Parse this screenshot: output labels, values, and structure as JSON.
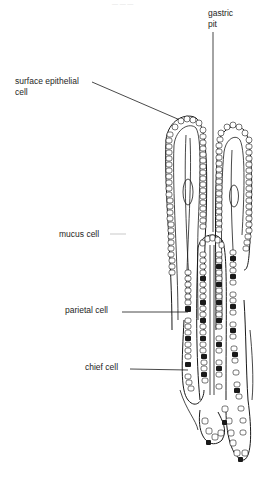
{
  "figure": {
    "top_caption": "— — —",
    "labels": {
      "gastric_pit": [
        "gastric",
        "pit"
      ],
      "surface_epithelial_cell": [
        "surface epithelial",
        "cell"
      ],
      "mucus_cell": "mucus cell",
      "parietal_cell": "parietal cell",
      "chief_cell": "chief cell"
    },
    "colors": {
      "line": "#1a1a1a",
      "background": "#ffffff",
      "parietal_fill": "#1a1a1a"
    }
  }
}
